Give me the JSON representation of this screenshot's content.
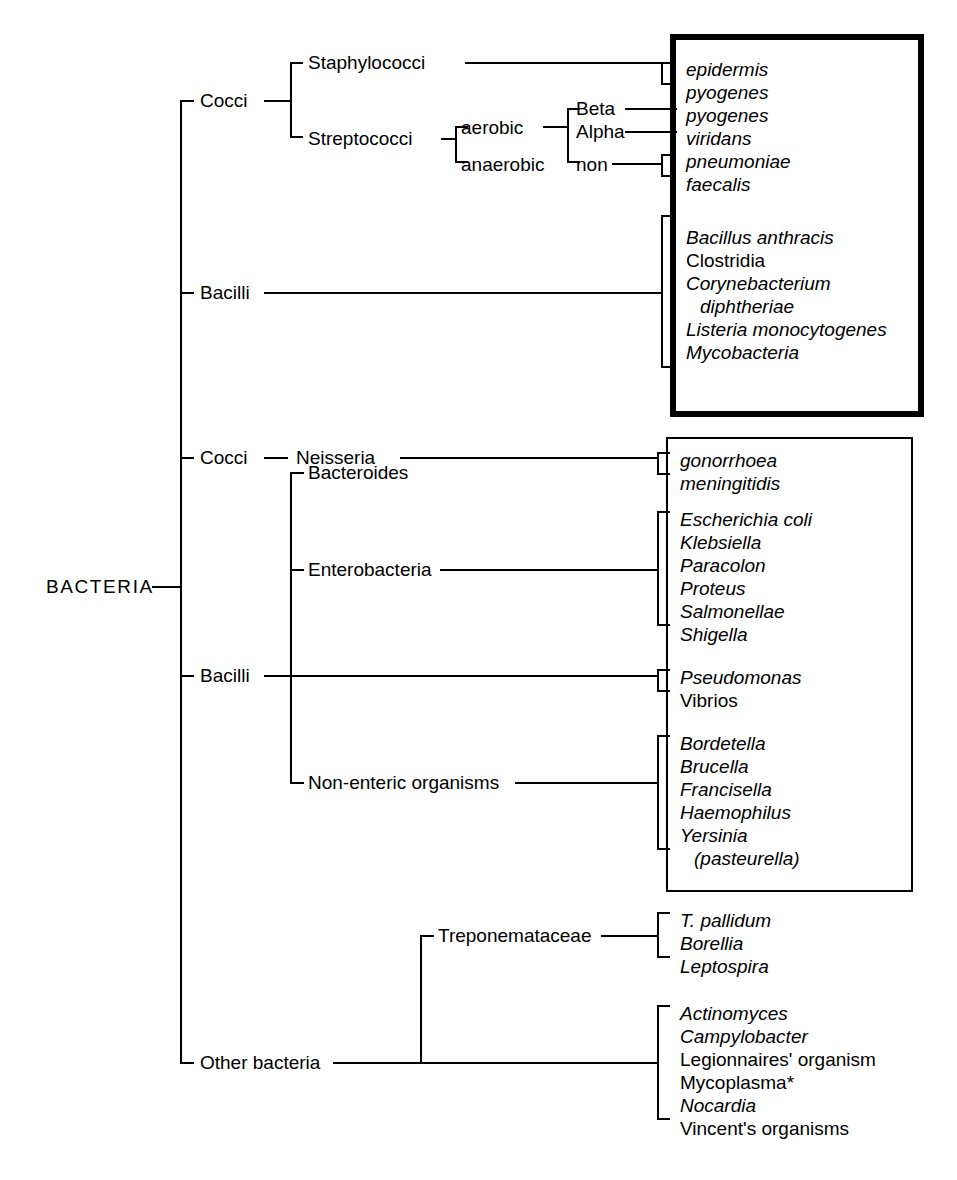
{
  "diagram": {
    "root_label": "BACTERIA",
    "line_color": "#000000",
    "background": "#ffffff"
  },
  "nodes": {
    "cocci_gram_pos": "Cocci",
    "bacilli_gram_pos": "Bacilli",
    "cocci_gram_neg": "Cocci",
    "bacilli_gram_neg": "Bacilli",
    "other_bacteria": "Other bacteria",
    "staphylococci": "Staphylococci",
    "streptococci": "Streptococci",
    "aerobic": "aerobic",
    "anaerobic": "anaerobic",
    "beta": "Beta",
    "alpha": "Alpha",
    "non": "non",
    "neisseria": "Neisseria",
    "bacteroides": "Bacteroides",
    "enterobacteria": "Enterobacteria",
    "non_enteric": "Non-enteric organisms",
    "treponemataceae": "Treponemataceae"
  },
  "organisms": {
    "staph": [
      {
        "name": "epidermis",
        "italic": true
      },
      {
        "name": "pyogenes",
        "italic": true
      }
    ],
    "strep_beta": [
      {
        "name": "pyogenes",
        "italic": true
      }
    ],
    "strep_alpha": [
      {
        "name": "viridans",
        "italic": true
      }
    ],
    "strep_non": [
      {
        "name": "pneumoniae",
        "italic": true
      },
      {
        "name": "faecalis",
        "italic": true
      }
    ],
    "gram_pos_bacilli": [
      {
        "name": "Bacillus anthracis",
        "italic": true
      },
      {
        "name": "Clostridia",
        "italic": false
      },
      {
        "name": "Corynebacterium",
        "italic": true
      },
      {
        "name": "diphtheriae",
        "italic": true,
        "indent": true
      },
      {
        "name": "Listeria monocytogenes",
        "italic": true
      },
      {
        "name": "Mycobacteria",
        "italic": true
      }
    ],
    "neisseria_species": [
      {
        "name": "gonorrhoea",
        "italic": true
      },
      {
        "name": "meningitidis",
        "italic": true
      }
    ],
    "enterobacteria_species": [
      {
        "name": "Escherichia coli",
        "italic": true
      },
      {
        "name": "Klebsiella",
        "italic": true
      },
      {
        "name": "Paracolon",
        "italic": true
      },
      {
        "name": "Proteus",
        "italic": true
      },
      {
        "name": "Salmonellae",
        "italic": true
      },
      {
        "name": "Shigella",
        "italic": true
      }
    ],
    "bacilli_other": [
      {
        "name": "Pseudomonas",
        "italic": true
      },
      {
        "name": "Vibrios",
        "italic": false
      }
    ],
    "non_enteric_species": [
      {
        "name": "Bordetella",
        "italic": true
      },
      {
        "name": "Brucella",
        "italic": true
      },
      {
        "name": "Francisella",
        "italic": true
      },
      {
        "name": "Haemophilus",
        "italic": true
      },
      {
        "name": "Yersinia",
        "italic": true
      },
      {
        "name": "(pasteurella)",
        "italic": true,
        "indent": true
      }
    ],
    "treponemataceae_species": [
      {
        "name": "T. pallidum",
        "italic": true
      },
      {
        "name": "Borellia",
        "italic": true
      },
      {
        "name": "Leptospira",
        "italic": true
      }
    ],
    "other_bacteria_species": [
      {
        "name": "Actinomyces",
        "italic": true
      },
      {
        "name": "Campylobacter",
        "italic": true
      },
      {
        "name": "Legionnaires' organism",
        "italic": false
      },
      {
        "name": "Mycoplasma*",
        "italic": false
      },
      {
        "name": "Nocardia",
        "italic": true
      },
      {
        "name": "Vincent's organisms",
        "italic": false
      }
    ]
  }
}
